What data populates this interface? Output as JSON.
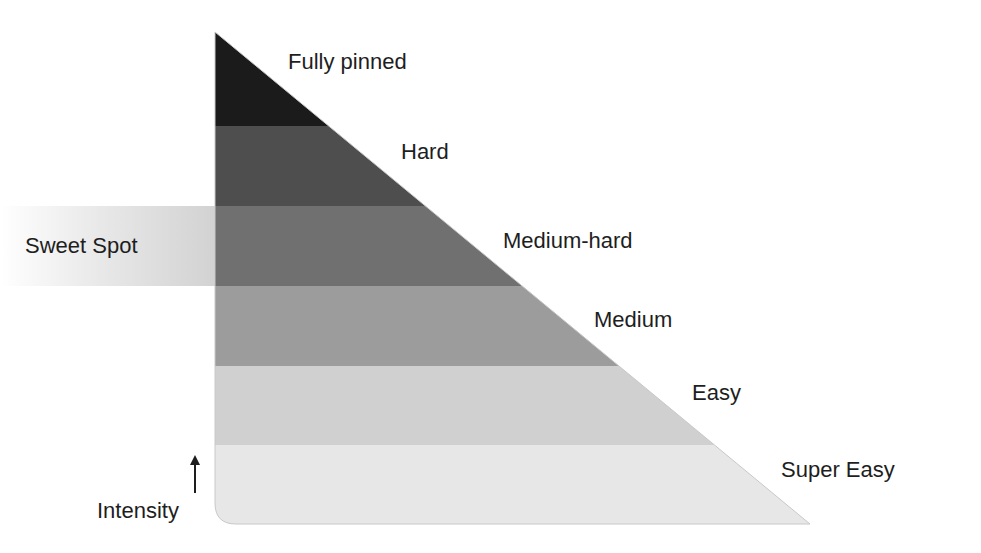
{
  "diagram": {
    "type": "intensity-triangle",
    "levels": [
      {
        "label": "Fully pinned",
        "color": "#1b1b1b",
        "y_top": 32,
        "y_bottom": 126
      },
      {
        "label": "Hard",
        "color": "#4e4e4e",
        "y_top": 126,
        "y_bottom": 206
      },
      {
        "label": "Medium-hard",
        "color": "#707070",
        "y_top": 206,
        "y_bottom": 286
      },
      {
        "label": "Medium",
        "color": "#9c9c9c",
        "y_top": 286,
        "y_bottom": 366
      },
      {
        "label": "Easy",
        "color": "#d0d0d0",
        "y_top": 366,
        "y_bottom": 445
      },
      {
        "label": "Super Easy",
        "color": "#e7e7e7",
        "y_top": 445,
        "y_bottom": 524
      }
    ],
    "highlight": {
      "label": "Sweet Spot",
      "level": "Medium-hard",
      "color": "#d2d2d2"
    },
    "axis": {
      "label": "Intensity",
      "arrow": "up-arrow"
    }
  }
}
